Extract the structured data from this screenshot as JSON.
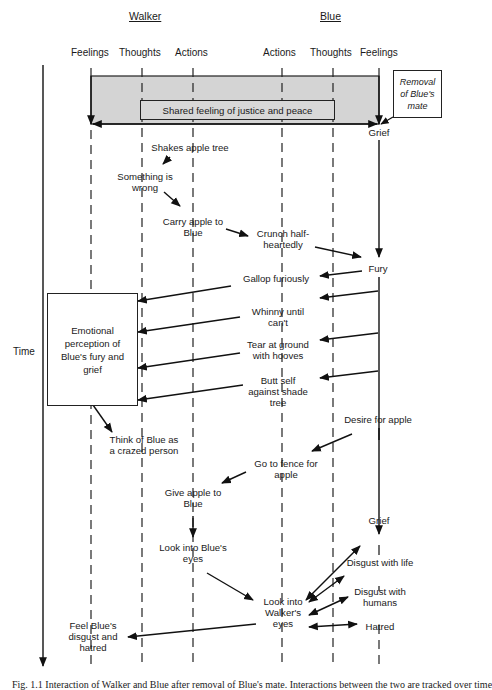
{
  "actors": {
    "walker": "Walker",
    "blue": "Blue"
  },
  "columns": {
    "walker": [
      "Feelings",
      "Thoughts",
      "Actions"
    ],
    "blue": [
      "Actions",
      "Thoughts",
      "Feelings"
    ]
  },
  "time_label": "Time",
  "shared_box": "Shared feeling of justice and peace",
  "trigger_box": "Removal\nof Blue's\nmate",
  "emotional_box": "Emotional\nperception of\nBlue's fury and\ngrief",
  "nodes": {
    "grief_1": "Grief",
    "shakes_apple_tree": "Shakes apple tree",
    "something_wrong": "Something is\nwrong",
    "carry_apple": "Carry apple to\nBlue",
    "crunch": "Crunch half-\nheartedly",
    "fury": "Fury",
    "gallop": "Gallop furiously",
    "whinny": "Whinny until\ncan't",
    "tear_ground": "Tear at ground\nwith hooves",
    "butt_self": "Butt self\nagainst shade\ntree",
    "think_of_blue": "Think of Blue as\na crazed person",
    "desire_apple": "Desire for apple",
    "go_to_fence": "Go to fence for\napple",
    "give_apple": "Give apple to\nBlue",
    "grief_2": "Grief",
    "look_blue_eyes": "Look into Blue's\neyes",
    "disgust_life": "Disgust with life",
    "disgust_humans": "Disgust with\nhumans",
    "look_walker_eyes": "Look into\nWalker's\neyes",
    "hatred": "Hatred",
    "feel_disgust": "Feel Blue's\ndisgust and\nhatred"
  },
  "caption": "Fig. 1.1  Interaction of Walker and Blue after removal of Blue's mate. Interactions between the two are tracked over time"
}
